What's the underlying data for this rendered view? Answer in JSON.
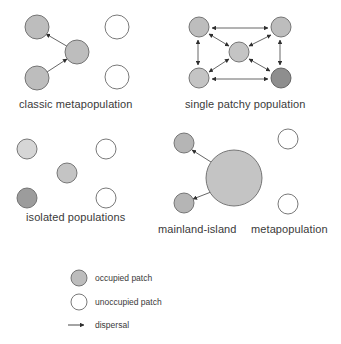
{
  "colors": {
    "occupied": "#bdbdbd",
    "occupied_light": "#d6d6d6",
    "occupied_dark": "#8e8e8e",
    "unoccupied": "#ffffff",
    "stroke": "#6a6a6a",
    "arrow": "#3a3a3a"
  },
  "panels": {
    "classic": {
      "label": "classic  metapopulation"
    },
    "patchy": {
      "label": "single patchy population"
    },
    "isolated": {
      "label": "isolated  populations"
    },
    "mainland": {
      "label_left": "mainland-island",
      "label_right": "metapopulation"
    }
  },
  "legend": {
    "occupied": "occupied patch",
    "unoccupied": "unoccupied patch",
    "dispersal": "dispersal"
  }
}
